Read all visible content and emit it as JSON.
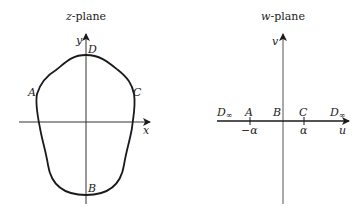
{
  "z_plane": {
    "title_var": "z",
    "title_rest": "-plane",
    "x_axis_label": "x",
    "y_axis_label": "y",
    "points": {
      "A": "A",
      "B": "B",
      "C": "C",
      "D": "D"
    }
  },
  "w_plane": {
    "title_var": "w",
    "title_rest": "-plane",
    "u_axis_label": "u",
    "v_axis_label": "v",
    "points": {
      "D_left": "D",
      "D_left_sub": "∞",
      "A": "A",
      "B": "B",
      "C": "C",
      "D_right": "D",
      "D_right_sub": "∞"
    },
    "ticks": {
      "neg_alpha": "−α",
      "alpha": "α"
    }
  },
  "colors": {
    "curve": "#1a1a1a",
    "axis": "#333333",
    "text": "#222222"
  }
}
